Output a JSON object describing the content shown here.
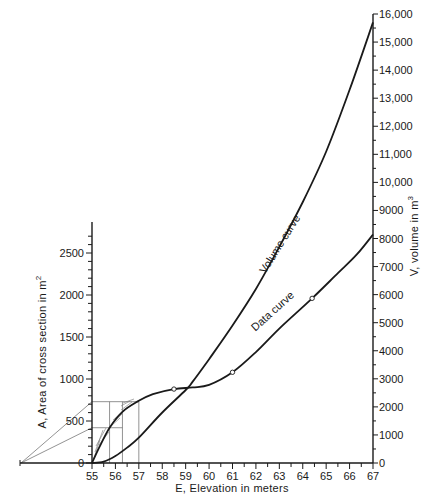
{
  "chart_data": {
    "type": "line",
    "title": "",
    "xlabel": "E, Elevation in meters",
    "ylabel_left": "A, Area of cross section in m²",
    "ylabel_right": "V, volume in m³",
    "xlim": [
      55,
      67
    ],
    "ylim_left": [
      0,
      2700
    ],
    "ylim_right": [
      0,
      16000
    ],
    "grid": false,
    "legend": "none (curves labeled inline)",
    "x_ticks": [
      55,
      56,
      57,
      58,
      59,
      60,
      61,
      62,
      63,
      64,
      65,
      66,
      67
    ],
    "y_left_ticks": [
      0,
      500,
      1000,
      1500,
      2000,
      2500
    ],
    "y_left_tick_labels": [
      "0",
      "500",
      "1000",
      "1500",
      "2000",
      "2500"
    ],
    "y_right_ticks": [
      0,
      1000,
      2000,
      3000,
      4000,
      5000,
      6000,
      7000,
      8000,
      9000,
      10000,
      11000,
      12000,
      13000,
      14000,
      15000,
      16000
    ],
    "y_right_tick_labels": [
      "0",
      "1000",
      "2000",
      "3000",
      "4000",
      "5000",
      "6000",
      "7000",
      "8000",
      "9000",
      "10,000",
      "11,000",
      "12,000",
      "13,000",
      "14,000",
      "15,000",
      "16,000"
    ],
    "series": [
      {
        "name": "Data curve",
        "axis": "left",
        "unit": "m²",
        "x": [
          55,
          55.3,
          55.75,
          56.3,
          57,
          57.6,
          58.5,
          59.3,
          60,
          61,
          62,
          63,
          64.4,
          65.5,
          66.3,
          67
        ],
        "values": [
          0,
          180,
          420,
          610,
          740,
          820,
          880,
          900,
          930,
          1080,
          1320,
          1600,
          1960,
          2260,
          2480,
          2720
        ],
        "marked_points": [
          {
            "x": 58.5,
            "y": 880
          },
          {
            "x": 61,
            "y": 1080
          },
          {
            "x": 64.4,
            "y": 1960
          }
        ]
      },
      {
        "name": "Volume curve",
        "axis": "right",
        "unit": "m³",
        "x": [
          55,
          55.5,
          56,
          56.5,
          57,
          58,
          59,
          59.3,
          60,
          61,
          62,
          63,
          64,
          65,
          66,
          67
        ],
        "values": [
          0,
          50,
          250,
          550,
          900,
          1800,
          2600,
          2900,
          3700,
          4900,
          6200,
          7700,
          9300,
          11100,
          13300,
          15700
        ]
      }
    ],
    "annotations": [
      {
        "text": "Volume curve",
        "near_x": 60.8,
        "rotation_deg": -58
      },
      {
        "text": "Data curve",
        "near_x": 62.8,
        "rotation_deg": -42
      },
      {
        "text": "Construction: horizontal at A≈730 to E=57 and A≈420 to E≈56.3; vertical lines at E≈55.75, 56.3, 57; slanted lines from pole left of origin; hatched strips between curve and construction"
      }
    ],
    "construction": {
      "pole_x_px": 21,
      "horizontals": [
        {
          "area": 730,
          "to_x": 57
        },
        {
          "area": 420,
          "to_x": 56.3
        }
      ],
      "verticals": [
        55.75,
        56.3,
        57
      ]
    }
  },
  "labels": {
    "xlabel": "E, Elevation in meters",
    "ylabel_left_main": "A, Area of cross section in m",
    "ylabel_left_sup": "2",
    "ylabel_right_main": "V, volume in m",
    "ylabel_right_sup": "3",
    "volume_curve": "Volume curve",
    "data_curve": "Data curve"
  },
  "style": {
    "line_color": "#1a1a1a",
    "construction_color": "#777777"
  }
}
